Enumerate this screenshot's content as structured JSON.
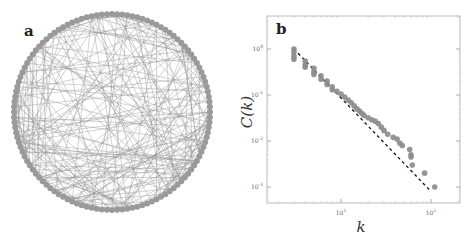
{
  "figure": {
    "panels": [
      {
        "label": "a",
        "type": "circular-network-graph",
        "node_color": "#9a9a9a",
        "edge_color": "#8c8c8c"
      },
      {
        "label": "b",
        "type": "log-log-scatter"
      }
    ]
  },
  "chart_data": [
    {
      "panel": "a",
      "type": "other",
      "description": "Circular layout network graph: nodes arranged on a circle with many chords (edges) connecting them",
      "title": "",
      "node_count_estimate": 120
    },
    {
      "panel": "b",
      "type": "scatter",
      "title": "",
      "xlabel": "k",
      "ylabel": "C(k)",
      "xscale": "log",
      "yscale": "log",
      "xlim": [
        2,
        200
      ],
      "ylim": [
        0.0004,
        5
      ],
      "x_tick_labels": [
        "10^1",
        "10^2"
      ],
      "x_ticks": [
        10,
        100
      ],
      "y_tick_labels": [
        "10^0",
        "10^-1",
        "10^-2",
        "10^-3"
      ],
      "y_ticks": [
        1,
        0.1,
        0.01,
        0.001
      ],
      "grid": false,
      "legend": null,
      "series": [
        {
          "name": "data",
          "style": "markers",
          "color": "#8a8a8a",
          "points": [
            [
              3,
              1.0
            ],
            [
              3,
              0.85
            ],
            [
              3,
              0.7
            ],
            [
              3,
              0.6
            ],
            [
              4,
              0.55
            ],
            [
              4,
              0.45
            ],
            [
              4,
              0.4
            ],
            [
              5,
              0.38
            ],
            [
              5,
              0.32
            ],
            [
              5,
              0.28
            ],
            [
              6,
              0.26
            ],
            [
              6,
              0.22
            ],
            [
              7,
              0.2
            ],
            [
              7,
              0.17
            ],
            [
              8,
              0.15
            ],
            [
              8,
              0.13
            ],
            [
              9,
              0.12
            ],
            [
              10,
              0.105
            ],
            [
              11,
              0.09
            ],
            [
              12,
              0.078
            ],
            [
              13,
              0.068
            ],
            [
              14,
              0.058
            ],
            [
              15,
              0.05
            ],
            [
              16,
              0.045
            ],
            [
              17,
              0.04
            ],
            [
              18,
              0.036
            ],
            [
              20,
              0.032
            ],
            [
              22,
              0.029
            ],
            [
              24,
              0.027
            ],
            [
              26,
              0.024
            ],
            [
              28,
              0.02
            ],
            [
              30,
              0.017
            ],
            [
              33,
              0.014
            ],
            [
              38,
              0.012
            ],
            [
              42,
              0.011
            ],
            [
              45,
              0.009
            ],
            [
              48,
              0.008
            ],
            [
              58,
              0.0065
            ],
            [
              60,
              0.005
            ],
            [
              60,
              0.0045
            ],
            [
              62,
              0.003
            ],
            [
              85,
              0.002
            ],
            [
              110,
              0.001
            ]
          ]
        },
        {
          "name": "power-law fit",
          "style": "dashed",
          "color": "#111111",
          "points": [
            [
              3,
              1.0
            ],
            [
              100,
              0.0008
            ]
          ]
        }
      ]
    }
  ]
}
